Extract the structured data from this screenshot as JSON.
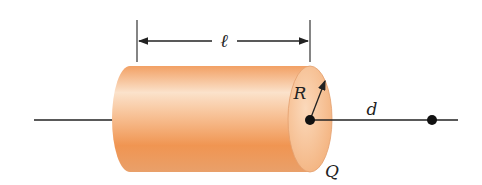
{
  "figure": {
    "labels": {
      "length": "ℓ",
      "radius": "R",
      "distance": "d",
      "charge": "Q"
    },
    "colors": {
      "cylinder_light": "#fbe3cc",
      "cylinder_mid": "#f5a466",
      "cylinder_dark": "#e8873f",
      "end_face": "#f6c49a",
      "line": "#222222"
    }
  }
}
